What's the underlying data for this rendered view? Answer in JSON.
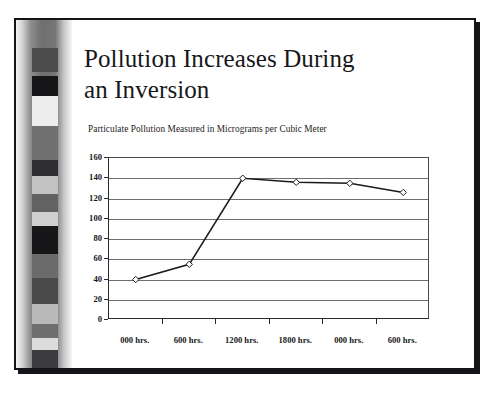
{
  "slide": {
    "title_line1": "Pollution Increases During",
    "title_line2": "an Inversion",
    "title_full": "Pollution Increases During an Inversion"
  },
  "chart_data": {
    "type": "line",
    "title": "Particulate Pollution Measured in Micrograms per Cubic Meter",
    "subtitle": "",
    "xlabel": "",
    "ylabel": "",
    "categories": [
      "000 hrs.",
      "600 hrs.",
      "1200 hrs.",
      "1800 hrs.",
      "000 hrs.",
      "600 hrs."
    ],
    "values": [
      40,
      55,
      140,
      136,
      135,
      126
    ],
    "series": [
      {
        "name": "Particulate Pollution",
        "values": [
          40,
          55,
          140,
          136,
          135,
          126
        ]
      }
    ],
    "ylim": [
      0,
      160
    ],
    "yticks": [
      0,
      20,
      40,
      60,
      80,
      100,
      120,
      140,
      160
    ],
    "ytick_labels": [
      "0",
      "20",
      "40",
      "60",
      "80",
      "100",
      "120",
      "140",
      "160"
    ],
    "grid": true,
    "grid_axis": "y",
    "legend": false,
    "legend_position": "none",
    "marker": "diamond",
    "marker_fill": "#ffffff",
    "marker_edge": "#1b1b1b",
    "line_color": "#1b1b1b",
    "plot_background": "#ffffff"
  },
  "filmstrip": {
    "name": "grayscale-calibration-strip",
    "patches": [
      {
        "top": 28,
        "height": 24,
        "color": "#4c4c4c"
      },
      {
        "top": 56,
        "height": 20,
        "color": "#17171a"
      },
      {
        "top": 76,
        "height": 30,
        "color": "#ededed"
      },
      {
        "top": 106,
        "height": 34,
        "color": "#6f6f6f"
      },
      {
        "top": 140,
        "height": 16,
        "color": "#2f2f33"
      },
      {
        "top": 156,
        "height": 18,
        "color": "#c2c2c2"
      },
      {
        "top": 174,
        "height": 18,
        "color": "#626262"
      },
      {
        "top": 192,
        "height": 14,
        "color": "#cfcfcf"
      },
      {
        "top": 206,
        "height": 28,
        "color": "#171719"
      },
      {
        "top": 234,
        "height": 24,
        "color": "#6b6b6b"
      },
      {
        "top": 258,
        "height": 26,
        "color": "#4a4a4a"
      },
      {
        "top": 284,
        "height": 20,
        "color": "#b9b9b9"
      },
      {
        "top": 304,
        "height": 14,
        "color": "#6e6e6e"
      },
      {
        "top": 318,
        "height": 12,
        "color": "#dcdcdc"
      },
      {
        "top": 330,
        "height": 18,
        "color": "#3b3b3f"
      }
    ]
  },
  "colors": {
    "ink": "#17171a",
    "frame": "#141418",
    "gridline": "#6d6d6d",
    "axis": "#2b2b2b",
    "page": "#ffffff"
  }
}
